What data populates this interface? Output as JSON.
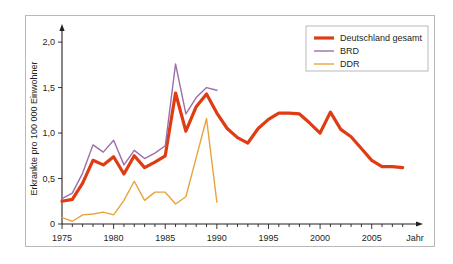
{
  "chart_data": {
    "type": "line",
    "title": "",
    "xlabel": "Jahr",
    "ylabel": "Erkrankte pro 100 000 Einwohner",
    "xlim": [
      1975,
      2009
    ],
    "ylim": [
      0,
      2.1
    ],
    "grid": false,
    "legend_position": "top-right",
    "x_ticks": [
      {
        "value": 1975,
        "label": "1975"
      },
      {
        "value": 1980,
        "label": "1980"
      },
      {
        "value": 1985,
        "label": "1985"
      },
      {
        "value": 1990,
        "label": "1990"
      },
      {
        "value": 1995,
        "label": "1995"
      },
      {
        "value": 2000,
        "label": "2000"
      },
      {
        "value": 2005,
        "label": "2005"
      }
    ],
    "y_ticks": [
      {
        "value": 0,
        "label": "0"
      },
      {
        "value": 0.5,
        "label": "0,5"
      },
      {
        "value": 1.0,
        "label": "1,0"
      },
      {
        "value": 1.5,
        "label": "1,5"
      },
      {
        "value": 2.0,
        "label": "2,0"
      }
    ],
    "series": [
      {
        "name": "Deutschland gesamt",
        "color": "#E03C14",
        "width": 3.2,
        "x": [
          1975,
          1976,
          1977,
          1978,
          1979,
          1980,
          1981,
          1982,
          1983,
          1984,
          1985,
          1986,
          1987,
          1988,
          1989,
          1990,
          1991,
          1992,
          1993,
          1994,
          1995,
          1996,
          1997,
          1998,
          1999,
          2000,
          2001,
          2002,
          2003,
          2004,
          2005,
          2006,
          2007,
          2008
        ],
        "values": [
          0.25,
          0.27,
          0.45,
          0.7,
          0.65,
          0.74,
          0.55,
          0.75,
          0.62,
          0.68,
          0.75,
          1.44,
          1.02,
          1.29,
          1.43,
          1.22,
          1.05,
          0.95,
          0.89,
          1.05,
          1.15,
          1.22,
          1.22,
          1.21,
          1.11,
          1.0,
          1.23,
          1.04,
          0.96,
          0.83,
          0.7,
          0.63,
          0.63,
          0.62
        ]
      },
      {
        "name": "BRD",
        "color": "#9B6FA8",
        "width": 1.4,
        "x": [
          1975,
          1976,
          1977,
          1978,
          1979,
          1980,
          1981,
          1982,
          1983,
          1984,
          1985,
          1986,
          1987,
          1988,
          1989,
          1990
        ],
        "values": [
          0.28,
          0.34,
          0.56,
          0.87,
          0.79,
          0.92,
          0.65,
          0.81,
          0.72,
          0.78,
          0.86,
          1.76,
          1.21,
          1.39,
          1.5,
          1.47
        ]
      },
      {
        "name": "DDR",
        "color": "#E8A33D",
        "width": 1.4,
        "x": [
          1975,
          1976,
          1977,
          1978,
          1979,
          1980,
          1981,
          1982,
          1983,
          1984,
          1985,
          1986,
          1987,
          1988,
          1989,
          1990
        ],
        "values": [
          0.07,
          0.03,
          0.1,
          0.11,
          0.13,
          0.1,
          0.26,
          0.47,
          0.26,
          0.35,
          0.35,
          0.22,
          0.3,
          0.73,
          1.16,
          0.24
        ]
      }
    ],
    "legend": [
      {
        "label": "Deutschland gesamt",
        "color": "#E03C14",
        "width": 3.2
      },
      {
        "label": "BRD",
        "color": "#9B6FA8",
        "width": 1.4
      },
      {
        "label": "DDR",
        "color": "#E8A33D",
        "width": 1.4
      }
    ],
    "axis_color": "#231f20",
    "frame_color": "#b9b9b9"
  }
}
